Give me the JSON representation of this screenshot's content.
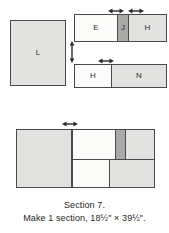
{
  "diagram": {
    "type": "quilt-block-assembly",
    "caption": {
      "line1": "Section 7.",
      "line2": "Make 1 section, 18½\" × 39½\"."
    },
    "colors": {
      "outline": "#4a4a4a",
      "fabric_light": "#e2e2e0",
      "fabric_white": "#fbfbfa",
      "fabric_dark": "#a9a9a7",
      "text": "#1d1d1d",
      "background": "#ffffff"
    },
    "components": {
      "block_l": {
        "label": "L",
        "name": "piece-l"
      },
      "strip_top": {
        "name": "unit-e-j-h",
        "pieces": [
          {
            "label": "E",
            "fill": "white"
          },
          {
            "label": "J",
            "fill": "dark"
          },
          {
            "label": "H",
            "fill": "light"
          }
        ]
      },
      "strip_bottom": {
        "name": "unit-h-n",
        "pieces": [
          {
            "label": "H",
            "fill": "white"
          },
          {
            "label": "N",
            "fill": "light"
          }
        ]
      },
      "assembled": {
        "name": "assembled-section",
        "pieces": [
          {
            "label": "L",
            "fill": "light"
          },
          {
            "label": "E",
            "fill": "white"
          },
          {
            "label": "J",
            "fill": "dark"
          },
          {
            "label": "H",
            "fill": "light"
          },
          {
            "label": "H",
            "fill": "white"
          },
          {
            "label": "N",
            "fill": "light"
          }
        ]
      }
    },
    "arrows": {
      "top_left_width": "double-arrow-horizontal",
      "top_right_width": "double-arrow-horizontal",
      "middle_height": "double-arrow-vertical",
      "bottom_strip_width": "double-arrow-horizontal",
      "assembled_width": "double-arrow-horizontal"
    }
  }
}
